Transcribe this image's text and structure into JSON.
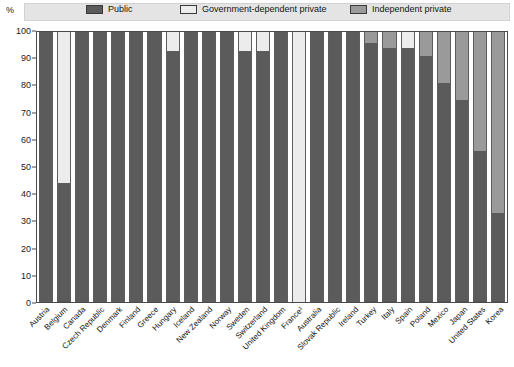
{
  "axis_unit_label": "%",
  "legend": [
    {
      "id": "public",
      "label": "Public",
      "color": "#5b5b5b"
    },
    {
      "id": "government-dependent-private",
      "label": "Government-dependent private",
      "color": "#ececec"
    },
    {
      "id": "independent-private",
      "label": "Independent private",
      "color": "#9a9a9a"
    }
  ],
  "y_ticks": [
    "0",
    "10",
    "20",
    "30",
    "40",
    "50",
    "60",
    "70",
    "80",
    "90",
    "100"
  ],
  "chart_data": {
    "type": "bar",
    "stacked": true,
    "stack_total": 100,
    "title": "",
    "subtitle": "",
    "xlabel": "",
    "ylabel": "%",
    "ylim": [
      0,
      100
    ],
    "ytick_step": 10,
    "grid": false,
    "legend_position": "top",
    "orientation": "vertical",
    "categories": [
      "Austria",
      "Belgium",
      "Canada",
      "Czech Republic",
      "Denmark",
      "Finland",
      "Greece",
      "Hungary",
      "Iceland",
      "New Zealand",
      "Norway",
      "Sweden",
      "Switzerland",
      "United Kingdom",
      "France¹",
      "Australia",
      "Slovak Republic",
      "Ireland",
      "Turkey",
      "Italy",
      "Spain",
      "Poland",
      "Mexico",
      "Japan",
      "United States",
      "Korea"
    ],
    "series": [
      {
        "name": "Public",
        "color": "#5b5b5b",
        "values": [
          100,
          44,
          100,
          100,
          100,
          100,
          100,
          93,
          100,
          100,
          100,
          93,
          93,
          100,
          0,
          100,
          100,
          100,
          96,
          94,
          94,
          91,
          81,
          75,
          56,
          33
        ]
      },
      {
        "name": "Government-dependent private",
        "color": "#ececec",
        "values": [
          0,
          56,
          0,
          0,
          0,
          0,
          0,
          7,
          0,
          0,
          0,
          7,
          7,
          0,
          100,
          0,
          0,
          0,
          0,
          0,
          6,
          0,
          0,
          0,
          0,
          0
        ]
      },
      {
        "name": "Independent private",
        "color": "#9a9a9a",
        "values": [
          0,
          0,
          0,
          0,
          0,
          0,
          0,
          0,
          0,
          0,
          0,
          0,
          0,
          0,
          0,
          0,
          0,
          0,
          4,
          6,
          0,
          9,
          19,
          25,
          44,
          67
        ]
      }
    ]
  }
}
